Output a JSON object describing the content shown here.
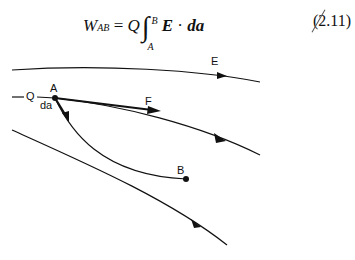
{
  "equation": {
    "lhs": "W",
    "lhs_sub": "AB",
    "equals": "=",
    "charge": "Q",
    "integral": "∫",
    "upper_limit": "B",
    "lower_limit": "A",
    "field": "E",
    "dot": "·",
    "element": "da",
    "number": "(2.11)"
  },
  "labels": {
    "E": "E",
    "Q": "Q",
    "A": "A",
    "da": "da",
    "F": "F",
    "B": "B"
  },
  "colors": {
    "line": "#111111",
    "background": "#ffffff"
  }
}
